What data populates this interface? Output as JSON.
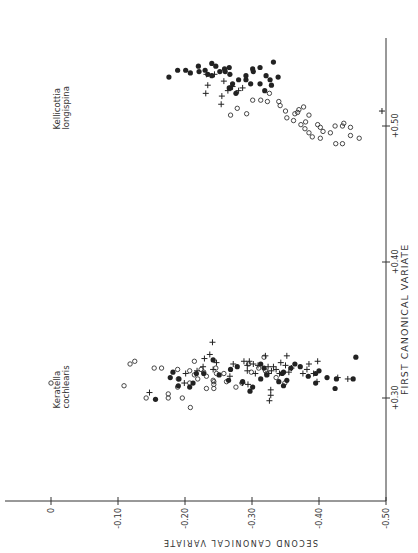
{
  "chart_data": {
    "type": "scatter",
    "orientation": "rotated 90 degrees clockwise (first canonical variate runs vertically on right, second canonical variate runs horizontally along bottom)",
    "title": "",
    "xlabel": "FIRST CANONICAL VARIATE",
    "ylabel": "SECOND CANONICAL VARIATE",
    "xlim": [
      0.225,
      0.545
    ],
    "ylim": [
      -0.5,
      0.07
    ],
    "x_ticks": [
      "+0.30",
      "+0.40",
      "+0.50"
    ],
    "x_tick_values": [
      0.3,
      0.4,
      0.5
    ],
    "y_ticks": [
      "0",
      "-0.10",
      "-0.20",
      "-0.30",
      "-0.40",
      "-0.50"
    ],
    "y_tick_values": [
      0,
      -0.1,
      -0.2,
      -0.3,
      -0.4,
      -0.5
    ],
    "grid": false,
    "legend": null,
    "annotations": [
      {
        "text": "Keratella\ncochlearis",
        "x": 0.31,
        "y": 0.02
      },
      {
        "text": "Kellicottia\nlongispina",
        "x": 0.515,
        "y": 0.02
      }
    ],
    "series": [
      {
        "name": "open-circle",
        "marker": "o",
        "points": [
          [
            0.311,
            0.0
          ],
          [
            0.309,
            -0.109
          ],
          [
            0.325,
            -0.118
          ],
          [
            0.327,
            -0.125
          ],
          [
            0.3,
            -0.142
          ],
          [
            0.322,
            -0.154
          ],
          [
            0.322,
            -0.165
          ],
          [
            0.3,
            -0.175
          ],
          [
            0.303,
            -0.175
          ],
          [
            0.321,
            -0.189
          ],
          [
            0.314,
            -0.19
          ],
          [
            0.308,
            -0.189
          ],
          [
            0.3,
            -0.196
          ],
          [
            0.32,
            -0.207
          ],
          [
            0.311,
            -0.207
          ],
          [
            0.327,
            -0.214
          ],
          [
            0.317,
            -0.214
          ],
          [
            0.314,
            -0.219
          ],
          [
            0.321,
            -0.224
          ],
          [
            0.319,
            -0.228
          ],
          [
            0.316,
            -0.232
          ],
          [
            0.307,
            -0.232
          ],
          [
            0.313,
            -0.242
          ],
          [
            0.31,
            -0.243
          ],
          [
            0.307,
            -0.243
          ],
          [
            0.322,
            -0.246
          ],
          [
            0.318,
            -0.247
          ],
          [
            0.318,
            -0.258
          ],
          [
            0.312,
            -0.262
          ],
          [
            0.308,
            -0.276
          ],
          [
            0.311,
            -0.285
          ],
          [
            0.325,
            -0.295
          ],
          [
            0.322,
            -0.31
          ],
          [
            0.32,
            -0.32
          ],
          [
            0.318,
            -0.322
          ],
          [
            0.315,
            -0.336
          ],
          [
            0.311,
            -0.349
          ],
          [
            0.33,
            -0.318
          ],
          [
            0.319,
            -0.299
          ],
          [
            0.312,
            -0.243
          ],
          [
            0.293,
            -0.208
          ],
          [
            0.513,
            -0.278
          ],
          [
            0.508,
            -0.268
          ],
          [
            0.509,
            -0.292
          ],
          [
            0.519,
            -0.301
          ],
          [
            0.519,
            -0.313
          ],
          [
            0.518,
            -0.323
          ],
          [
            0.524,
            -0.326
          ],
          [
            0.515,
            -0.342
          ],
          [
            0.511,
            -0.35
          ],
          [
            0.506,
            -0.352
          ],
          [
            0.504,
            -0.362
          ],
          [
            0.509,
            -0.364
          ],
          [
            0.512,
            -0.37
          ],
          [
            0.514,
            -0.377
          ],
          [
            0.508,
            -0.385
          ],
          [
            0.501,
            -0.398
          ],
          [
            0.499,
            -0.402
          ],
          [
            0.496,
            -0.406
          ],
          [
            0.503,
            -0.38
          ],
          [
            0.501,
            -0.373
          ],
          [
            0.498,
            -0.379
          ],
          [
            0.495,
            -0.385
          ],
          [
            0.492,
            -0.39
          ],
          [
            0.491,
            -0.402
          ],
          [
            0.495,
            -0.417
          ],
          [
            0.5,
            -0.424
          ],
          [
            0.5,
            -0.435
          ],
          [
            0.493,
            -0.447
          ],
          [
            0.491,
            -0.46
          ],
          [
            0.487,
            -0.435
          ],
          [
            0.487,
            -0.425
          ],
          [
            0.51,
            -0.368
          ],
          [
            0.518,
            -0.34
          ],
          [
            0.502,
            -0.437
          ],
          [
            0.499,
            -0.447
          ]
        ]
      },
      {
        "name": "filled-circle",
        "marker": "•",
        "points": [
          [
            0.299,
            -0.156
          ],
          [
            0.315,
            -0.178
          ],
          [
            0.319,
            -0.182
          ],
          [
            0.314,
            -0.191
          ],
          [
            0.309,
            -0.19
          ],
          [
            0.308,
            -0.207
          ],
          [
            0.311,
            -0.212
          ],
          [
            0.318,
            -0.217
          ],
          [
            0.318,
            -0.228
          ],
          [
            0.328,
            -0.242
          ],
          [
            0.317,
            -0.251
          ],
          [
            0.313,
            -0.265
          ],
          [
            0.321,
            -0.268
          ],
          [
            0.323,
            -0.278
          ],
          [
            0.312,
            -0.286
          ],
          [
            0.305,
            -0.297
          ],
          [
            0.308,
            -0.301
          ],
          [
            0.314,
            -0.313
          ],
          [
            0.325,
            -0.313
          ],
          [
            0.322,
            -0.318
          ],
          [
            0.317,
            -0.322
          ],
          [
            0.312,
            -0.34
          ],
          [
            0.309,
            -0.347
          ],
          [
            0.318,
            -0.345
          ],
          [
            0.322,
            -0.358
          ],
          [
            0.325,
            -0.364
          ],
          [
            0.323,
            -0.372
          ],
          [
            0.316,
            -0.384
          ],
          [
            0.311,
            -0.395
          ],
          [
            0.318,
            -0.395
          ],
          [
            0.32,
            -0.4
          ],
          [
            0.315,
            -0.412
          ],
          [
            0.307,
            -0.424
          ],
          [
            0.314,
            -0.426
          ],
          [
            0.314,
            -0.451
          ],
          [
            0.33,
            -0.455
          ],
          [
            0.319,
            -0.347
          ],
          [
            0.313,
            -0.352
          ],
          [
            0.536,
            -0.176
          ],
          [
            0.541,
            -0.189
          ],
          [
            0.541,
            -0.201
          ],
          [
            0.539,
            -0.208
          ],
          [
            0.544,
            -0.22
          ],
          [
            0.54,
            -0.221
          ],
          [
            0.541,
            -0.23
          ],
          [
            0.538,
            -0.234
          ],
          [
            0.546,
            -0.24
          ],
          [
            0.544,
            -0.246
          ],
          [
            0.54,
            -0.252
          ],
          [
            0.542,
            -0.259
          ],
          [
            0.538,
            -0.267
          ],
          [
            0.531,
            -0.271
          ],
          [
            0.534,
            -0.28
          ],
          [
            0.537,
            -0.291
          ],
          [
            0.534,
            -0.291
          ],
          [
            0.528,
            -0.268
          ],
          [
            0.524,
            -0.276
          ],
          [
            0.531,
            -0.298
          ],
          [
            0.54,
            -0.302
          ],
          [
            0.526,
            -0.319
          ],
          [
            0.543,
            -0.312
          ],
          [
            0.531,
            -0.312
          ],
          [
            0.534,
            -0.327
          ],
          [
            0.53,
            -0.329
          ],
          [
            0.528,
            -0.266
          ],
          [
            0.543,
            -0.266
          ],
          [
            0.542,
            -0.301
          ],
          [
            0.537,
            -0.321
          ],
          [
            0.536,
            -0.339
          ],
          [
            0.547,
            -0.332
          ],
          [
            0.537,
            -0.24
          ],
          [
            0.54,
            -0.26
          ]
        ]
      },
      {
        "name": "cross",
        "marker": "+",
        "points": [
          [
            0.304,
            -0.147
          ],
          [
            0.318,
            -0.201
          ],
          [
            0.311,
            -0.199
          ],
          [
            0.32,
            -0.218
          ],
          [
            0.323,
            -0.227
          ],
          [
            0.341,
            -0.241
          ],
          [
            0.329,
            -0.229
          ],
          [
            0.326,
            -0.247
          ],
          [
            0.332,
            -0.237
          ],
          [
            0.321,
            -0.242
          ],
          [
            0.316,
            -0.267
          ],
          [
            0.325,
            -0.272
          ],
          [
            0.311,
            -0.286
          ],
          [
            0.327,
            -0.288
          ],
          [
            0.324,
            -0.293
          ],
          [
            0.32,
            -0.293
          ],
          [
            0.327,
            -0.296
          ],
          [
            0.325,
            -0.302
          ],
          [
            0.318,
            -0.305
          ],
          [
            0.31,
            -0.294
          ],
          [
            0.331,
            -0.32
          ],
          [
            0.323,
            -0.324
          ],
          [
            0.318,
            -0.325
          ],
          [
            0.32,
            -0.329
          ],
          [
            0.323,
            -0.332
          ],
          [
            0.321,
            -0.336
          ],
          [
            0.318,
            -0.341
          ],
          [
            0.326,
            -0.343
          ],
          [
            0.324,
            -0.35
          ],
          [
            0.319,
            -0.355
          ],
          [
            0.322,
            -0.359
          ],
          [
            0.325,
            -0.385
          ],
          [
            0.318,
            -0.376
          ],
          [
            0.321,
            -0.382
          ],
          [
            0.318,
            -0.392
          ],
          [
            0.327,
            -0.398
          ],
          [
            0.306,
            -0.328
          ],
          [
            0.302,
            -0.328
          ],
          [
            0.298,
            -0.326
          ],
          [
            0.324,
            -0.309
          ],
          [
            0.315,
            -0.428
          ],
          [
            0.314,
            -0.443
          ],
          [
            0.331,
            -0.352
          ],
          [
            0.312,
            -0.397
          ],
          [
            0.524,
            -0.231
          ],
          [
            0.53,
            -0.234
          ],
          [
            0.538,
            -0.244
          ],
          [
            0.533,
            -0.258
          ],
          [
            0.526,
            -0.264
          ],
          [
            0.529,
            -0.271
          ],
          [
            0.526,
            -0.28
          ],
          [
            0.528,
            -0.286
          ],
          [
            0.522,
            -0.255
          ],
          [
            0.516,
            -0.254
          ],
          [
            0.538,
            -0.232
          ],
          [
            0.511,
            -0.494
          ]
        ]
      }
    ]
  }
}
